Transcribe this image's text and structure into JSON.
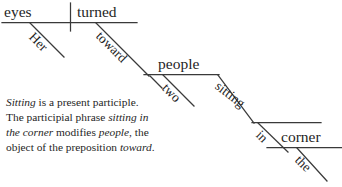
{
  "diagram": {
    "type": "sentence-diagram",
    "sentence": "Her eyes turned toward two people sitting in the corner.",
    "colors": {
      "line": "#3a3a3a",
      "text": "#1f1f1f",
      "background": "#ffffff"
    },
    "words": {
      "subject": "eyes",
      "verb": "turned",
      "subject_modifier": "Her",
      "preposition": "toward",
      "prep_object": "people",
      "object_modifier": "two",
      "participle": "sitting",
      "participle_preposition": "in",
      "participle_prep_object": "corner",
      "corner_modifier": "the"
    }
  },
  "note": {
    "line1_italic": "Sitting",
    "line1_rest": " is a present participle.",
    "line2_pre": "The participial phrase ",
    "line2_italic": "sitting in",
    "line3_italic": "the corner",
    "line3_mid": " modifies ",
    "line3_italic2": "people",
    "line3_rest": ", the",
    "line4_pre": "object of the preposition ",
    "line4_italic": "toward",
    "line4_rest": "."
  }
}
